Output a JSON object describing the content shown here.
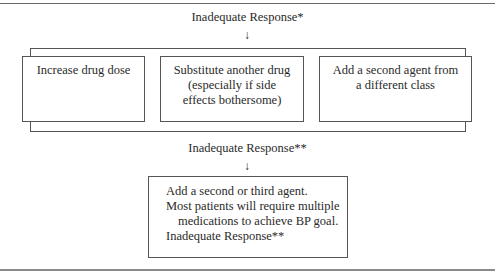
{
  "top_response": "Inadequate Response*",
  "second_response": "Inadequate Response**",
  "arrow_glyph": "↓",
  "options": [
    {
      "lines": [
        "Increase drug dose"
      ]
    },
    {
      "lines": [
        "Substitute another drug",
        "(especially if side",
        "effects bothersome)"
      ]
    },
    {
      "lines": [
        "Add a second agent from",
        "a different class"
      ]
    }
  ],
  "final_box": {
    "lines": [
      "Add a second or third agent.",
      "Most patients will require multiple",
      "medications to achieve BP goal.",
      "Inadequate Response**"
    ]
  }
}
